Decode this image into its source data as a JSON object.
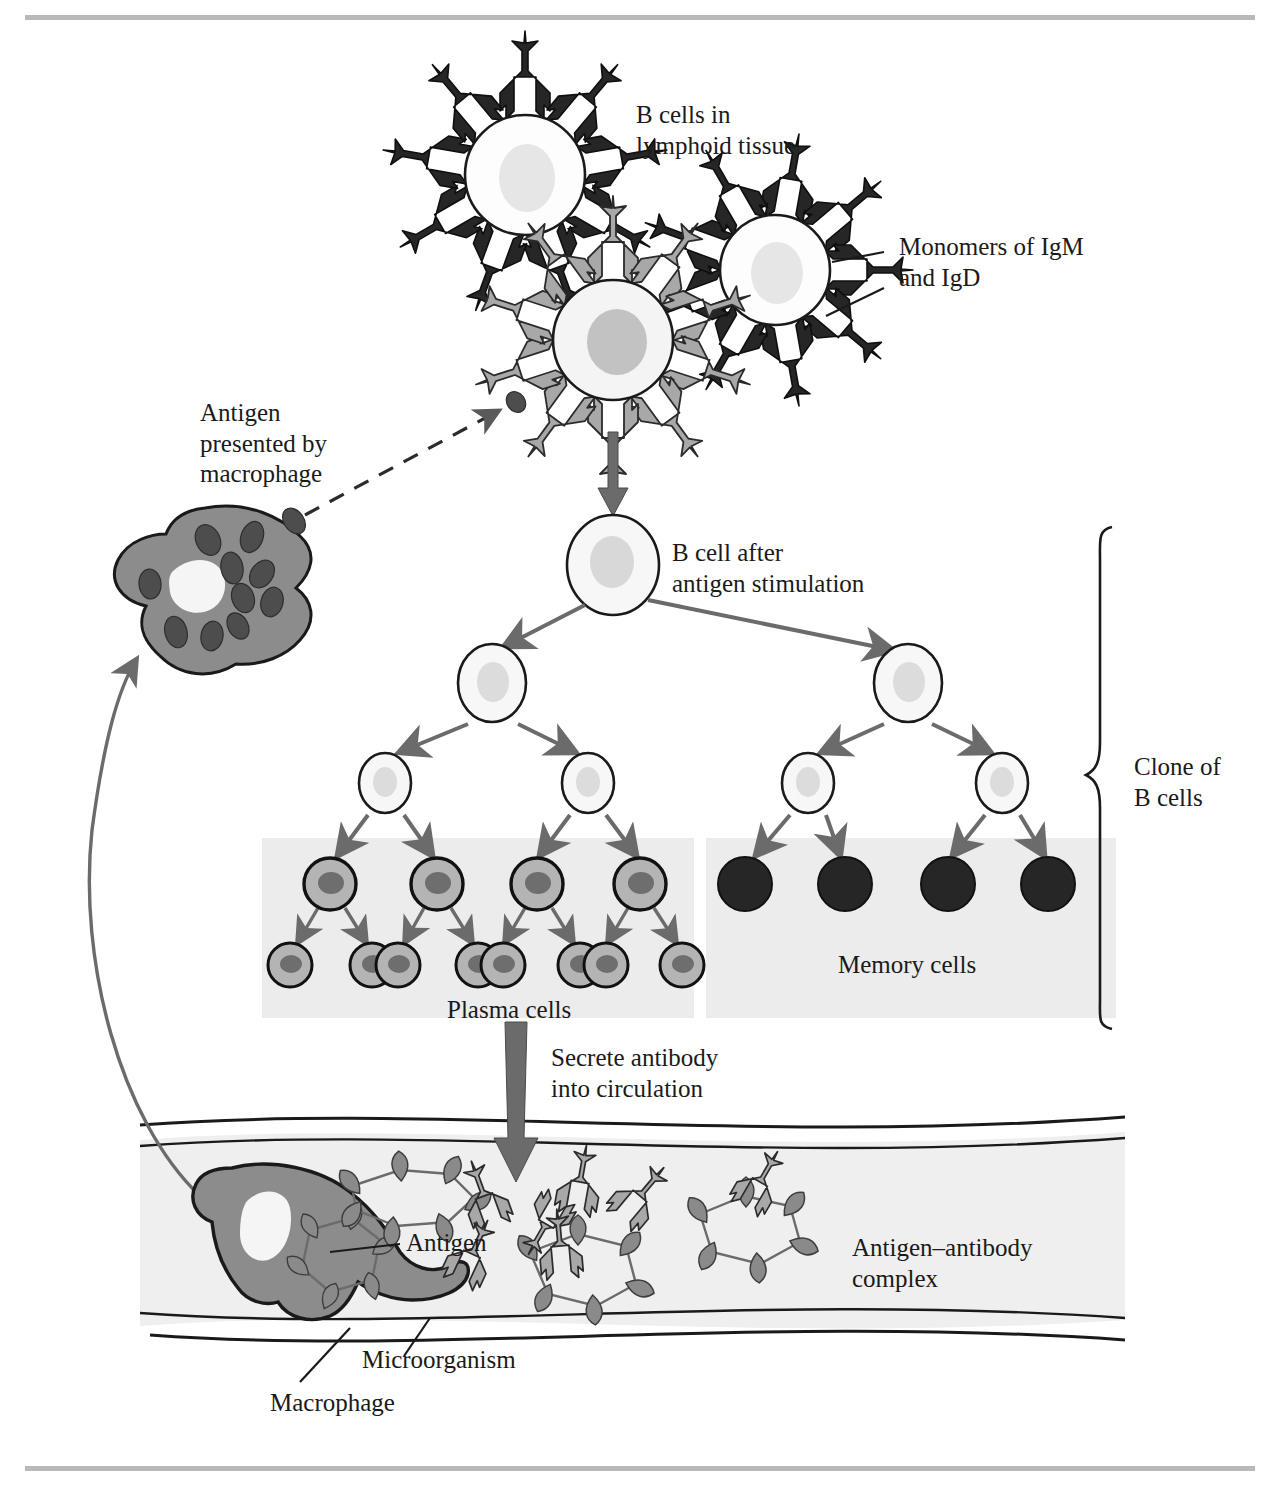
{
  "figure": {
    "background_color": "#ffffff",
    "rule_color": "#b9b9b9"
  },
  "labels": {
    "b_cells_lymphoid": "B cells in\nlymphoid tissue",
    "monomers": "Monomers of IgM\nand IgD",
    "antigen_presented": "Antigen\npresented by\nmacrophage",
    "b_cell_after": "B cell after\nantigen stimulation",
    "clone_of_b_cells": "Clone of\nB cells",
    "plasma_cells": "Plasma cells",
    "memory_cells": "Memory cells",
    "secrete_antibody": "Secrete antibody\ninto circulation",
    "antigen": "Antigen",
    "antigen_antibody_complex": "Antigen–antibody\ncomplex",
    "microorganism": "Microorganism",
    "macrophage": "Macrophage"
  },
  "colors": {
    "outline": "#1a1a1a",
    "antibody_dark": "#262626",
    "antibody_gray": "#a8a8a8",
    "cell_fill_white": "#fdfdfd",
    "cell_fill_pale": "#f2f2f2",
    "nucleus_pale": "#d8d8d8",
    "nucleus_gray": "#c2c2c2",
    "plasma_cell_fill": "#b4b4b4",
    "plasma_nucleus": "#6e6e6e",
    "memory_cell_fill": "#262626",
    "macrophage_fill": "#8c8c8c",
    "macrophage_nucleus": "#f5f5f5",
    "granule": "#4d4d4d",
    "panel_fill": "#ececec",
    "vessel_fill": "#efefef",
    "arrow_gray": "#6b6b6b",
    "microorganism_fill": "#8a8a8a"
  },
  "cell_groups": {
    "surface_b_cells": [
      {
        "name": "b-cell-top-left",
        "cx": 525,
        "cy": 175,
        "r": 60,
        "antibody_color": "dark",
        "antibody_count": 9
      },
      {
        "name": "b-cell-right",
        "cx": 775,
        "cy": 270,
        "r": 55,
        "antibody_color": "dark",
        "antibody_count": 9
      },
      {
        "name": "b-cell-center-activated",
        "cx": 613,
        "cy": 340,
        "r": 60,
        "antibody_color": "gray",
        "antibody_count": 10
      }
    ],
    "stimulated_cell": {
      "cx": 613,
      "cy": 565,
      "rx": 46,
      "ry": 49
    },
    "generation_1": [
      {
        "cx": 492,
        "cy": 683
      },
      {
        "cx": 908,
        "cy": 683
      }
    ],
    "generation_2": [
      {
        "cx": 385,
        "cy": 783
      },
      {
        "cx": 588,
        "cy": 783
      },
      {
        "cx": 808,
        "cy": 783
      },
      {
        "cx": 1002,
        "cy": 783
      }
    ],
    "plasma_row_1": [
      {
        "cx": 330,
        "cy": 884
      },
      {
        "cx": 437,
        "cy": 884
      },
      {
        "cx": 537,
        "cy": 884
      },
      {
        "cx": 640,
        "cy": 884
      }
    ],
    "plasma_row_2": [
      {
        "cx": 297,
        "cy": 965
      },
      {
        "cx": 370,
        "cy": 965
      },
      {
        "cx": 441,
        "cy": 965
      },
      {
        "cx": 510,
        "cy": 965
      },
      {
        "cx": 578,
        "cy": 965
      },
      {
        "cx": 647,
        "cy": 965
      },
      {
        "cx": 700,
        "cy": 965
      },
      {
        "cx": 672,
        "cy": 965
      }
    ],
    "memory_cells": [
      {
        "cx": 745,
        "cy": 884
      },
      {
        "cx": 845,
        "cy": 884
      },
      {
        "cx": 948,
        "cy": 884
      },
      {
        "cx": 1048,
        "cy": 884
      }
    ],
    "counts": {
      "plasma_large": 4,
      "plasma_small": 8,
      "memory": 4,
      "generation_1": 2,
      "generation_2": 4
    }
  },
  "panels": {
    "plasma_panel": {
      "x": 262,
      "y": 838,
      "w": 432,
      "h": 180
    },
    "memory_panel": {
      "x": 706,
      "y": 838,
      "w": 410,
      "h": 180
    }
  },
  "vessel": {
    "top": 1128,
    "bottom": 1330,
    "label": "blood-vessel"
  },
  "bracket": {
    "x": 1105,
    "y_top": 527,
    "y_bottom": 1022,
    "label": "clone-brace"
  }
}
